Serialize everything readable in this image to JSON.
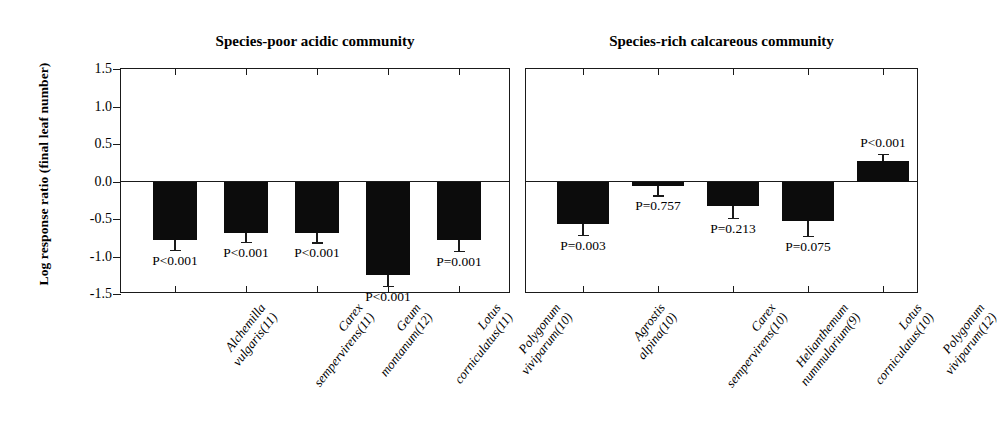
{
  "figure": {
    "ylabel": "Log response ratio (final leaf number)",
    "y_ticks": [
      "1.5",
      "1.0",
      "0.5",
      "0.0",
      "-0.5",
      "-1.0",
      "-1.5"
    ]
  },
  "chart_data": [
    {
      "type": "bar",
      "title": "Species-poor acidic community",
      "xlabel": "",
      "ylabel": "Log response ratio (final leaf number)",
      "ylim": [
        -1.5,
        1.5
      ],
      "yticks": [
        -1.5,
        -1.0,
        -0.5,
        0.0,
        0.5,
        1.0,
        1.5
      ],
      "grid": false,
      "legend": "none",
      "categories": [
        "Alchemilla vulgaris(11)",
        "Carex sempervirens(11)",
        "Geum montanum(12)",
        "Lotus corniculatus(11)",
        "Polygonum viviparum(10)"
      ],
      "category_lines": [
        [
          "Alchemilla",
          "vulgaris(11)"
        ],
        [
          "Carex",
          "sempervirens(11)"
        ],
        [
          "Geum",
          "montanum(12)"
        ],
        [
          "Lotus",
          "corniculatus(11)"
        ],
        [
          "Polygonum",
          "viviparum(10)"
        ]
      ],
      "values": [
        -0.78,
        -0.68,
        -0.69,
        -1.25,
        -0.78
      ],
      "errors": [
        0.13,
        0.12,
        0.12,
        0.14,
        0.14
      ],
      "annotations": [
        "P<0.001",
        "P<0.001",
        "P<0.001",
        "P<0.001",
        "P=0.001"
      ]
    },
    {
      "type": "bar",
      "title": "Species-rich calcareous community",
      "xlabel": "",
      "ylabel": "Log response ratio (final leaf number)",
      "ylim": [
        -1.5,
        1.5
      ],
      "yticks": [
        -1.5,
        -1.0,
        -0.5,
        0.0,
        0.5,
        1.0,
        1.5
      ],
      "grid": false,
      "legend": "none",
      "categories": [
        "Agrostis alpina(10)",
        "Carex sempervirens(10)",
        "Helianthemum nummularium(9)",
        "Lotus corniculatus(10)",
        "Polygonum viviparum(12)"
      ],
      "category_lines": [
        [
          "Agrostis",
          "alpina(10)"
        ],
        [
          "Carex",
          "sempervirens(10)"
        ],
        [
          "Helianthemum",
          "nummularium(9)"
        ],
        [
          "Lotus",
          "corniculatus(10)"
        ],
        [
          "Polygonum",
          "viviparum(12)"
        ]
      ],
      "values": [
        -0.57,
        -0.06,
        -0.33,
        -0.52,
        0.28
      ],
      "errors": [
        0.14,
        0.12,
        0.15,
        0.2,
        0.09
      ],
      "annotations": [
        "P=0.003",
        "P=0.757",
        "P=0.213",
        "P=0.075",
        "P<0.001"
      ]
    }
  ]
}
